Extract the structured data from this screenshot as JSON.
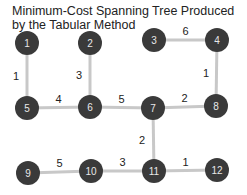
{
  "title_line1": "Minimum-Cost Spanning Tree Produced",
  "title_line2": "by the Tabular Method",
  "nodes": [
    {
      "id": 1,
      "label": "1"
    },
    {
      "id": 2,
      "label": "2"
    },
    {
      "id": 3,
      "label": "3"
    },
    {
      "id": 4,
      "label": "4"
    },
    {
      "id": 5,
      "label": "5"
    },
    {
      "id": 6,
      "label": "6"
    },
    {
      "id": 7,
      "label": "7"
    },
    {
      "id": 8,
      "label": "8"
    },
    {
      "id": 9,
      "label": "9"
    },
    {
      "id": 10,
      "label": "10"
    },
    {
      "id": 11,
      "label": "11"
    },
    {
      "id": 12,
      "label": "12"
    }
  ],
  "edges": [
    {
      "from": 1,
      "to": 5,
      "weight": "1"
    },
    {
      "from": 2,
      "to": 6,
      "weight": "3"
    },
    {
      "from": 3,
      "to": 4,
      "weight": "6"
    },
    {
      "from": 4,
      "to": 8,
      "weight": "1"
    },
    {
      "from": 5,
      "to": 6,
      "weight": "4"
    },
    {
      "from": 6,
      "to": 7,
      "weight": "5"
    },
    {
      "from": 7,
      "to": 8,
      "weight": "2"
    },
    {
      "from": 7,
      "to": 11,
      "weight": "2"
    },
    {
      "from": 9,
      "to": 10,
      "weight": "5"
    },
    {
      "from": 10,
      "to": 11,
      "weight": "3"
    },
    {
      "from": 11,
      "to": 12,
      "weight": "1"
    }
  ]
}
